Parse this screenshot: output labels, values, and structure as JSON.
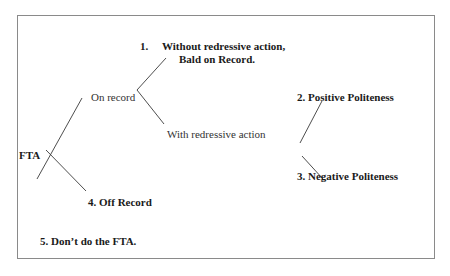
{
  "diagram": {
    "root": {
      "label": "FTA"
    },
    "branches": {
      "on_record": {
        "label": "On record"
      },
      "without_redress": {
        "number": "1.",
        "line1": "Without redressive action,",
        "line2": "Bald on Record."
      },
      "with_redress": {
        "label": "With redressive action"
      },
      "positive": {
        "label": "2. Positive Politeness"
      },
      "negative": {
        "label": "3. Negative Politeness"
      },
      "off_record": {
        "label": "4. Off Record"
      },
      "dont": {
        "label": "5. Don’t do the FTA."
      }
    },
    "colors": {
      "line": "#3a3a3a",
      "frame": "#8a8a8a",
      "text": "#1a1a1a"
    }
  }
}
